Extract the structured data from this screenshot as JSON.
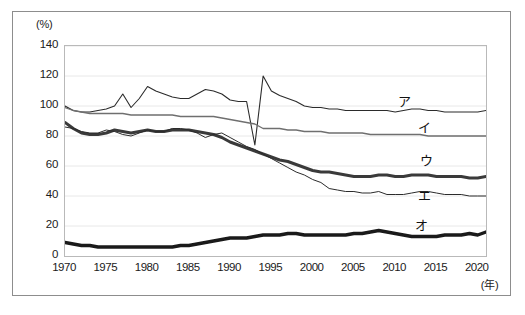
{
  "chart_data": {
    "type": "line",
    "title": "",
    "subtitle": "",
    "xlabel": "(年)",
    "ylabel": "(%)",
    "xlim": [
      1970,
      2021
    ],
    "ylim": [
      0,
      140
    ],
    "y_ticks": [
      0,
      20,
      40,
      60,
      80,
      100,
      120,
      140
    ],
    "x_ticks": [
      1970,
      1975,
      1980,
      1985,
      1990,
      1995,
      2000,
      2005,
      2010,
      2015,
      2020
    ],
    "grid": "horizontal",
    "legend_position": "inline-right",
    "x": [
      1970,
      1971,
      1972,
      1973,
      1974,
      1975,
      1976,
      1977,
      1978,
      1979,
      1980,
      1981,
      1982,
      1983,
      1984,
      1985,
      1986,
      1987,
      1988,
      1989,
      1990,
      1991,
      1992,
      1993,
      1994,
      1995,
      1996,
      1997,
      1998,
      1999,
      2000,
      2001,
      2002,
      2003,
      2004,
      2005,
      2006,
      2007,
      2008,
      2009,
      2010,
      2011,
      2012,
      2013,
      2014,
      2015,
      2016,
      2017,
      2018,
      2019,
      2020,
      2021
    ],
    "series": [
      {
        "name": "ア",
        "label": "ア",
        "color": "#2b2b2b",
        "width": 1.1,
        "values": [
          100,
          97,
          96,
          96,
          97,
          98,
          100,
          108,
          99,
          105,
          113,
          110,
          108,
          106,
          105,
          105,
          108,
          111,
          110,
          108,
          104,
          103,
          103,
          74,
          120,
          110,
          107,
          105,
          103,
          100,
          99,
          99,
          98,
          98,
          97,
          97,
          97,
          97,
          97,
          97,
          96,
          97,
          98,
          98,
          97,
          97,
          96,
          96,
          96,
          96,
          96,
          97
        ]
      },
      {
        "name": "イ",
        "label": "イ",
        "color": "#6f6f6f",
        "width": 1.3,
        "values": [
          99,
          97,
          96,
          95,
          95,
          95,
          95,
          95,
          94,
          94,
          94,
          94,
          94,
          94,
          93,
          93,
          93,
          93,
          93,
          92,
          91,
          90,
          89,
          88,
          85,
          85,
          85,
          84,
          84,
          83,
          83,
          83,
          82,
          82,
          82,
          82,
          82,
          81,
          81,
          81,
          81,
          81,
          81,
          81,
          80,
          80,
          80,
          80,
          80,
          80,
          80,
          80
        ]
      },
      {
        "name": "ウ",
        "label": "ウ",
        "color": "#3a3a3a",
        "width": 3.0,
        "values": [
          89,
          85,
          82,
          81,
          81,
          82,
          84,
          83,
          82,
          83,
          84,
          83,
          83,
          84,
          84,
          84,
          83,
          82,
          81,
          79,
          76,
          74,
          72,
          70,
          68,
          66,
          64,
          63,
          61,
          59,
          57,
          56,
          56,
          55,
          54,
          53,
          53,
          53,
          54,
          54,
          53,
          53,
          54,
          54,
          54,
          53,
          53,
          53,
          53,
          52,
          52,
          53
        ]
      },
      {
        "name": "エ",
        "label": "エ",
        "color": "#2b2b2b",
        "width": 1.0,
        "values": [
          86,
          85,
          83,
          82,
          82,
          84,
          83,
          81,
          80,
          82,
          84,
          83,
          83,
          85,
          85,
          84,
          82,
          79,
          81,
          82,
          79,
          76,
          73,
          71,
          68,
          65,
          62,
          59,
          56,
          54,
          51,
          49,
          45,
          44,
          43,
          43,
          42,
          42,
          43,
          41,
          41,
          41,
          42,
          43,
          43,
          42,
          41,
          41,
          41,
          40,
          40,
          40
        ]
      },
      {
        "name": "オ",
        "label": "オ",
        "color": "#1a1a1a",
        "width": 3.4,
        "values": [
          9,
          8,
          7,
          7,
          6,
          6,
          6,
          6,
          6,
          6,
          6,
          6,
          6,
          6,
          7,
          7,
          8,
          9,
          10,
          11,
          12,
          12,
          12,
          13,
          14,
          14,
          14,
          15,
          15,
          14,
          14,
          14,
          14,
          14,
          14,
          15,
          15,
          16,
          17,
          16,
          15,
          14,
          13,
          13,
          13,
          13,
          14,
          14,
          14,
          15,
          14,
          16
        ]
      }
    ],
    "annotations": [
      {
        "text": "ア",
        "series": "ア",
        "x_px": 398,
        "y_px": 91
      },
      {
        "text": "イ",
        "series": "イ",
        "x_px": 418,
        "y_px": 117
      },
      {
        "text": "ウ",
        "series": "ウ",
        "x_px": 420,
        "y_px": 150
      },
      {
        "text": "エ",
        "series": "エ",
        "x_px": 418,
        "y_px": 185
      },
      {
        "text": "オ",
        "series": "オ",
        "x_px": 415,
        "y_px": 215
      }
    ]
  },
  "axes": {
    "y_unit": "(%)",
    "x_unit": "(年)",
    "y_tick_labels": [
      "140",
      "120",
      "100",
      "80",
      "60",
      "40",
      "20",
      "0"
    ],
    "x_tick_labels": [
      "1970",
      "1975",
      "1980",
      "1985",
      "1990",
      "1995",
      "2000",
      "2005",
      "2010",
      "2015",
      "2020"
    ]
  }
}
